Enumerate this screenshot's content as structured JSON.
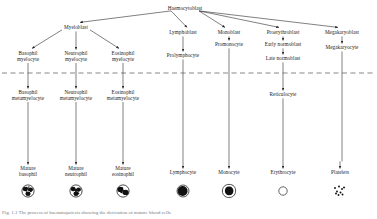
{
  "figure": {
    "caption": "Fig. 1.1  The process of haematopoiesis showing the derivation of mature blood cells",
    "colors": {
      "ink": "#1a1a1a",
      "line": "#333333",
      "dashed_divider": "#555555",
      "background": "#ffffff",
      "cell_fill": "#1a1a1a"
    },
    "divider": {
      "name": "bone-marrow-blood-divider",
      "style": "dashed",
      "y": 73
    }
  },
  "nodes": [
    {
      "id": "haemocytoblast",
      "label": "Haemocytoblast",
      "x": 185,
      "y": 6,
      "lines": [
        "Haemocytoblast"
      ]
    },
    {
      "id": "myeloblast",
      "label": "Myeloblast",
      "x": 76,
      "y": 25,
      "lines": [
        "Myeloblast"
      ]
    },
    {
      "id": "lymphoblast",
      "label": "Lymphoblast",
      "x": 183,
      "y": 30,
      "lines": [
        "Lymphoblast"
      ]
    },
    {
      "id": "monoblast",
      "label": "Monoblast",
      "x": 229,
      "y": 30,
      "lines": [
        "Monoblast"
      ]
    },
    {
      "id": "proerythroblast",
      "label": "Proerythroblast",
      "x": 283,
      "y": 30,
      "lines": [
        "Proerythroblast"
      ]
    },
    {
      "id": "megakaryoblast",
      "label": "Megakaryoblast",
      "x": 342,
      "y": 30,
      "lines": [
        "Megakaryoblast"
      ]
    },
    {
      "id": "basophil-myelocyte",
      "label": "Basophil myelocyte",
      "x": 28,
      "y": 51,
      "lines": [
        "Basophil",
        "myelocyte"
      ]
    },
    {
      "id": "neutrophil-myelocyte",
      "label": "Neutrophil myelocyte",
      "x": 76,
      "y": 51,
      "lines": [
        "Neutrophil",
        "myelocyte"
      ]
    },
    {
      "id": "eosinophil-myelocyte",
      "label": "Eosinophil myelocyte",
      "x": 123,
      "y": 51,
      "lines": [
        "Eosinophil",
        "myelocyte"
      ]
    },
    {
      "id": "prolymphocyte",
      "label": "Prolymphocyte",
      "x": 183,
      "y": 53,
      "lines": [
        "Prolymphocyte"
      ]
    },
    {
      "id": "promonocyte",
      "label": "Promonocyte",
      "x": 229,
      "y": 42,
      "lines": [
        "Promonocyte"
      ]
    },
    {
      "id": "early-normoblast",
      "label": "Early normoblast",
      "x": 283,
      "y": 42,
      "lines": [
        "Early normoblast"
      ]
    },
    {
      "id": "late-normoblast",
      "label": "Late normoblast",
      "x": 283,
      "y": 56,
      "lines": [
        "Late normoblast"
      ]
    },
    {
      "id": "megakaryocyte",
      "label": "Megakaryocyte",
      "x": 342,
      "y": 45,
      "lines": [
        "Megakaryocyte"
      ]
    },
    {
      "id": "basophil-metamyelocyte",
      "label": "Basophil metamyelocyte",
      "x": 28,
      "y": 90,
      "lines": [
        "Basophil",
        "metamyelocyte"
      ]
    },
    {
      "id": "neutrophil-metamyelocyte",
      "label": "Neutrophil metamyelocyte",
      "x": 76,
      "y": 90,
      "lines": [
        "Neutrophil",
        "metamyelocyte"
      ]
    },
    {
      "id": "eosinophil-metamyelocyte",
      "label": "Eosinophil metamyelocyte",
      "x": 123,
      "y": 90,
      "lines": [
        "Eosinophil",
        "metamyelocyte"
      ]
    },
    {
      "id": "reticulocyte",
      "label": "Reticulocyte",
      "x": 283,
      "y": 92,
      "lines": [
        "Reticulocyte"
      ]
    },
    {
      "id": "mature-basophil",
      "label": "Mature basophil",
      "x": 28,
      "y": 166,
      "lines": [
        "Mature",
        "basophil"
      ]
    },
    {
      "id": "mature-neutrophil",
      "label": "Mature neutrophil",
      "x": 76,
      "y": 166,
      "lines": [
        "Mature",
        "neutrophil"
      ]
    },
    {
      "id": "mature-eosinophil",
      "label": "Mature eosinophil",
      "x": 123,
      "y": 166,
      "lines": [
        "Mature",
        "eosinophil"
      ]
    },
    {
      "id": "lymphocyte",
      "label": "Lymphocyte",
      "x": 183,
      "y": 170,
      "lines": [
        "Lymphocyte"
      ]
    },
    {
      "id": "monocyte",
      "label": "Monocyte",
      "x": 229,
      "y": 170,
      "lines": [
        "Monocyte"
      ]
    },
    {
      "id": "erythrocyte",
      "label": "Erythrocyte",
      "x": 283,
      "y": 170,
      "lines": [
        "Erythrocyte"
      ]
    },
    {
      "id": "platelets",
      "label": "Platelets",
      "x": 340,
      "y": 170,
      "lines": [
        "Platelets"
      ]
    }
  ],
  "cells": [
    {
      "id": "cell-basophil",
      "for": "mature-basophil",
      "x": 28,
      "y": 191,
      "shape": "granulocyte-basophil"
    },
    {
      "id": "cell-neutrophil",
      "for": "mature-neutrophil",
      "x": 76,
      "y": 191,
      "shape": "granulocyte-neutrophil"
    },
    {
      "id": "cell-eosinophil",
      "for": "mature-eosinophil",
      "x": 123,
      "y": 191,
      "shape": "granulocyte-eosinophil"
    },
    {
      "id": "cell-lymphocyte",
      "for": "lymphocyte",
      "x": 183,
      "y": 191,
      "shape": "lymphocyte"
    },
    {
      "id": "cell-monocyte",
      "for": "monocyte",
      "x": 229,
      "y": 191,
      "shape": "monocyte"
    },
    {
      "id": "cell-erythrocyte",
      "for": "erythrocyte",
      "x": 283,
      "y": 191,
      "shape": "erythrocyte-ring"
    },
    {
      "id": "cell-platelets",
      "for": "platelets",
      "x": 340,
      "y": 191,
      "shape": "platelet-dots"
    }
  ],
  "edges": [
    {
      "from": "haemocytoblast",
      "to": "myeloblast",
      "type": "arrow-diagonal"
    },
    {
      "from": "haemocytoblast",
      "to": "lymphoblast",
      "type": "arrow-vertical"
    },
    {
      "from": "haemocytoblast",
      "to": "monoblast",
      "type": "arrow-diagonal"
    },
    {
      "from": "haemocytoblast",
      "to": "proerythroblast",
      "type": "arrow-diagonal"
    },
    {
      "from": "haemocytoblast",
      "to": "megakaryoblast",
      "type": "arrow-diagonal"
    },
    {
      "from": "myeloblast",
      "to": "basophil-myelocyte",
      "type": "arrow-diagonal"
    },
    {
      "from": "myeloblast",
      "to": "neutrophil-myelocyte",
      "type": "arrow-vertical"
    },
    {
      "from": "myeloblast",
      "to": "eosinophil-myelocyte",
      "type": "arrow-diagonal"
    },
    {
      "from": "basophil-myelocyte",
      "to": "basophil-metamyelocyte",
      "type": "arrow-vertical"
    },
    {
      "from": "neutrophil-myelocyte",
      "to": "neutrophil-metamyelocyte",
      "type": "arrow-vertical"
    },
    {
      "from": "eosinophil-myelocyte",
      "to": "eosinophil-metamyelocyte",
      "type": "arrow-vertical"
    },
    {
      "from": "lymphoblast",
      "to": "prolymphocyte",
      "type": "arrow-vertical"
    },
    {
      "from": "monoblast",
      "to": "promonocyte",
      "type": "arrow-vertical"
    },
    {
      "from": "proerythroblast",
      "to": "early-normoblast",
      "type": "arrow-vertical"
    },
    {
      "from": "early-normoblast",
      "to": "late-normoblast",
      "type": "arrow-vertical"
    },
    {
      "from": "late-normoblast",
      "to": "reticulocyte",
      "type": "arrow-vertical"
    },
    {
      "from": "megakaryoblast",
      "to": "megakaryocyte",
      "type": "arrow-vertical"
    },
    {
      "from": "basophil-metamyelocyte",
      "to": "mature-basophil",
      "type": "line-then-arrow"
    },
    {
      "from": "neutrophil-metamyelocyte",
      "to": "mature-neutrophil",
      "type": "line-then-arrow"
    },
    {
      "from": "eosinophil-metamyelocyte",
      "to": "mature-eosinophil",
      "type": "line-then-arrow"
    },
    {
      "from": "prolymphocyte",
      "to": "lymphocyte",
      "type": "line-then-arrow"
    },
    {
      "from": "promonocyte",
      "to": "monocyte",
      "type": "line-then-arrow"
    },
    {
      "from": "reticulocyte",
      "to": "erythrocyte",
      "type": "line-then-arrow"
    },
    {
      "from": "megakaryocyte",
      "to": "platelets",
      "type": "line-then-arrow"
    }
  ]
}
